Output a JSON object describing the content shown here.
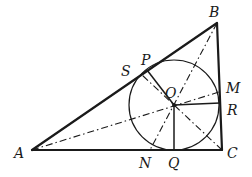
{
  "figure": {
    "points": {
      "A": {
        "label": "A"
      },
      "B": {
        "label": "B"
      },
      "C": {
        "label": "C"
      },
      "O": {
        "label": "O"
      },
      "P": {
        "label": "P"
      },
      "S": {
        "label": "S"
      },
      "M": {
        "label": "M"
      },
      "R": {
        "label": "R"
      },
      "N": {
        "label": "N"
      },
      "Q": {
        "label": "Q"
      }
    },
    "segments": {
      "sides": [
        "AB",
        "BC",
        "CA"
      ],
      "radii": [
        "OP",
        "OQ",
        "OR"
      ],
      "bisectors": [
        "AM",
        "BN",
        "CS"
      ]
    },
    "incircle": {
      "center": "O",
      "tangent_points": [
        "P",
        "Q",
        "R"
      ]
    },
    "colors": {
      "stroke": "#1a1a1a",
      "background": "#ffffff"
    }
  }
}
